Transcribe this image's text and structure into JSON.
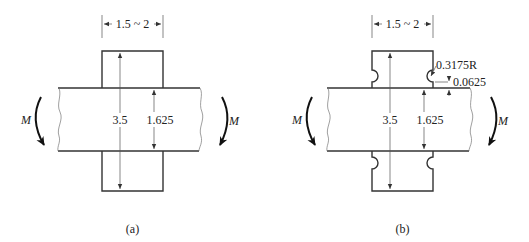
{
  "figure_a": {
    "caption": "(a)",
    "width_dim": "1.5 ~ 2",
    "total_height_dim": "3.5",
    "plate_thickness_dim": "1.625",
    "moment_left": "M",
    "moment_right": "M"
  },
  "figure_b": {
    "caption": "(b)",
    "width_dim": "1.5 ~ 2",
    "total_height_dim": "3.5",
    "plate_thickness_dim": "1.625",
    "notch_radius": "0.3175R",
    "notch_offset": "0.0625",
    "moment_left": "M",
    "moment_right": "M"
  },
  "colors": {
    "line": "#333333",
    "background": "#ffffff"
  }
}
